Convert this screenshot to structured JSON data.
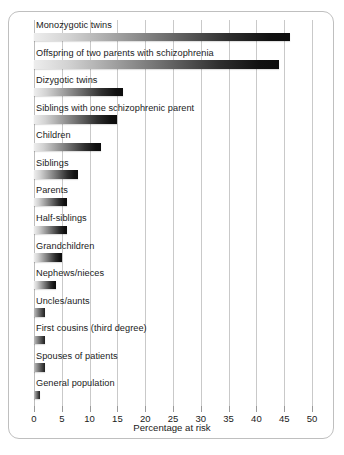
{
  "chart_data": {
    "type": "bar",
    "orientation": "horizontal",
    "title": "",
    "xlabel": "Percentage at risk",
    "ylabel": "",
    "xlim": [
      0,
      50
    ],
    "grid": true,
    "legend_position": "none",
    "xticks": [
      0,
      5,
      10,
      15,
      20,
      25,
      30,
      35,
      40,
      45,
      50
    ],
    "xtick_labels": [
      "0",
      "5",
      "10",
      "15",
      "20",
      "25",
      "30",
      "35",
      "40",
      "45",
      "50"
    ],
    "categories": [
      "Monozygotic twins",
      "Offspring of two parents with schizophrenia",
      "Dizygotic twins",
      "Siblings with one schizophrenic parent",
      "Children",
      "Siblings",
      "Parents",
      "Half-siblings",
      "Grandchildren",
      "Nephews/nieces",
      "Uncles/aunts",
      "First cousins (third degree)",
      "Spouses of patients",
      "General population"
    ],
    "values": [
      46,
      44,
      16,
      15,
      12,
      8,
      6,
      6,
      5,
      4,
      2,
      2,
      2,
      1
    ],
    "units": "percent"
  },
  "axis": {
    "title": "Percentage at risk"
  }
}
